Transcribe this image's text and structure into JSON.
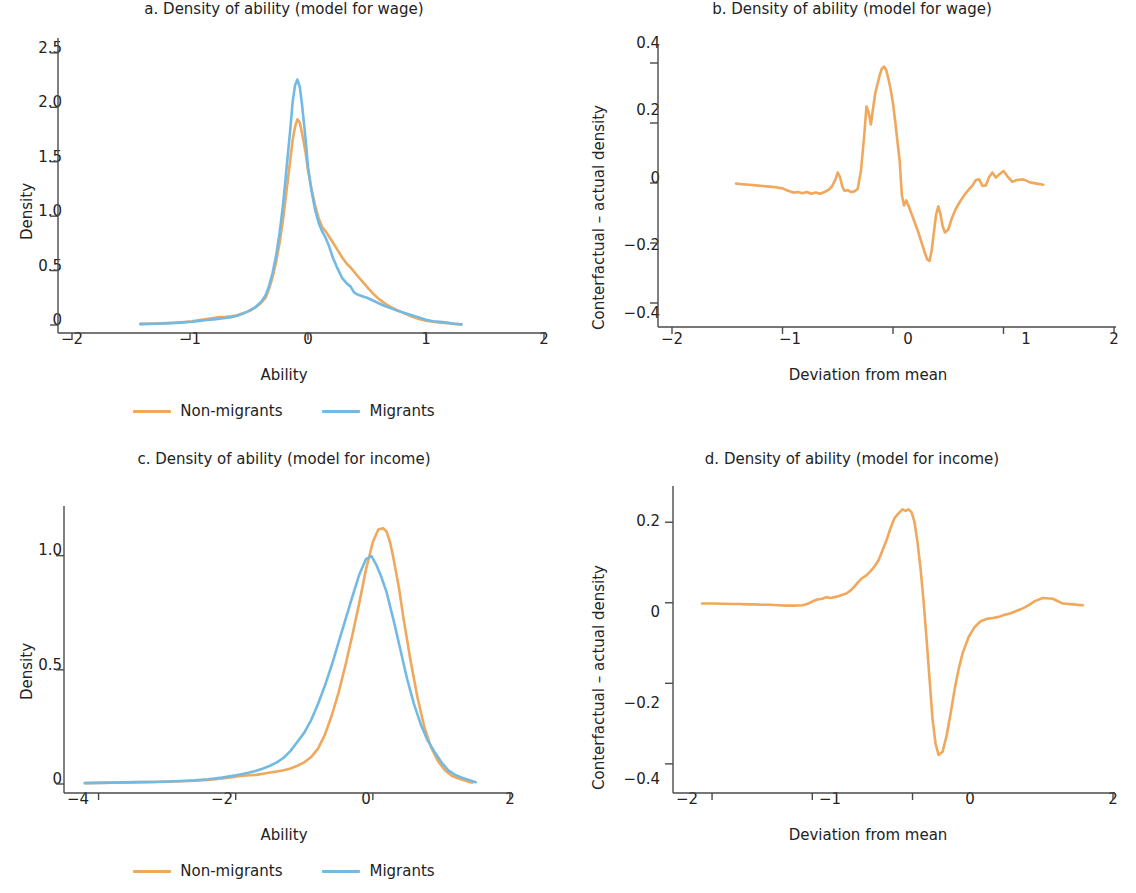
{
  "figure": {
    "background": "#ffffff",
    "series_colors": {
      "non_migrants": "#efa85c",
      "migrants": "#72bae4"
    },
    "axis_color": "#4a4a4a",
    "text_color": "#232323"
  },
  "legend": {
    "items": [
      {
        "label": "Non-migrants",
        "color": "#efa85c"
      },
      {
        "label": "Migrants",
        "color": "#72bae4"
      }
    ]
  },
  "panels": [
    {
      "id": "a",
      "title": "a. Density of ability (model for wage)",
      "xlabel": "Ability",
      "ylabel": "Density",
      "xticks": [
        "−2",
        "−1",
        "0",
        "1",
        "2"
      ],
      "yticks": [
        "0",
        "0.5",
        "1.0",
        "1.5",
        "2.0",
        "2.5"
      ]
    },
    {
      "id": "b",
      "title": "b. Density of ability (model for wage)",
      "xlabel": "Deviation from mean",
      "ylabel": "Conterfactual – actual density",
      "xticks": [
        "−2",
        "−1",
        "0",
        "1",
        "2"
      ],
      "yticks": [
        "−0.4",
        "−0.2",
        "0",
        "0.2",
        "0.4"
      ]
    },
    {
      "id": "c",
      "title": "c. Density of ability (model for income)",
      "xlabel": "Ability",
      "ylabel": "Density",
      "xticks": [
        "−4",
        "−2",
        "0",
        "2"
      ],
      "yticks": [
        "0",
        "0.5",
        "1.0"
      ]
    },
    {
      "id": "d",
      "title": "d. Density of ability (model for income)",
      "xlabel": "Deviation from mean",
      "ylabel": "Conterfactual – actual density",
      "xticks": [
        "−2",
        "−1",
        "0",
        "2"
      ],
      "yticks": [
        "−0.4",
        "−0.2",
        "0",
        "0.2"
      ]
    }
  ],
  "chart_data": [
    {
      "panel": "a",
      "type": "line",
      "title": "a. Density of ability (model for wage)",
      "xlabel": "Ability",
      "ylabel": "Density",
      "xlim": [
        -2,
        2
      ],
      "ylim": [
        0,
        2.6
      ],
      "xticks": [
        -2,
        -1,
        0,
        1,
        2
      ],
      "yticks": [
        0,
        0.5,
        1.0,
        1.5,
        2.0,
        2.5
      ],
      "grid": false,
      "legend_position": "below",
      "series": [
        {
          "name": "Non-migrants",
          "color": "#efa85c",
          "x": [
            -1.42,
            -1.35,
            -1.28,
            -1.2,
            -1.12,
            -1.05,
            -0.98,
            -0.92,
            -0.86,
            -0.8,
            -0.75,
            -0.7,
            -0.65,
            -0.6,
            -0.56,
            -0.52,
            -0.48,
            -0.44,
            -0.4,
            -0.36,
            -0.33,
            -0.3,
            -0.27,
            -0.24,
            -0.21,
            -0.18,
            -0.15,
            -0.13,
            -0.11,
            -0.09,
            -0.07,
            -0.05,
            -0.02,
            0.0,
            0.03,
            0.06,
            0.09,
            0.12,
            0.15,
            0.18,
            0.21,
            0.25,
            0.29,
            0.33,
            0.36,
            0.39,
            0.42,
            0.46,
            0.5,
            0.55,
            0.6,
            0.65,
            0.7,
            0.76,
            0.82,
            0.88,
            0.94,
            1.0,
            1.06,
            1.12,
            1.18,
            1.24,
            1.3
          ],
          "y": [
            0.01,
            0.012,
            0.014,
            0.018,
            0.022,
            0.028,
            0.035,
            0.045,
            0.055,
            0.065,
            0.072,
            0.075,
            0.08,
            0.09,
            0.105,
            0.12,
            0.14,
            0.165,
            0.2,
            0.25,
            0.33,
            0.44,
            0.58,
            0.76,
            0.98,
            1.25,
            1.52,
            1.7,
            1.82,
            1.89,
            1.86,
            1.76,
            1.58,
            1.42,
            1.25,
            1.1,
            0.98,
            0.9,
            0.86,
            0.81,
            0.76,
            0.69,
            0.62,
            0.56,
            0.53,
            0.49,
            0.45,
            0.4,
            0.35,
            0.29,
            0.24,
            0.2,
            0.165,
            0.135,
            0.105,
            0.078,
            0.055,
            0.04,
            0.03,
            0.022,
            0.016,
            0.01,
            0.006
          ]
        },
        {
          "name": "Migrants",
          "color": "#72bae4",
          "x": [
            -1.42,
            -1.35,
            -1.28,
            -1.2,
            -1.12,
            -1.05,
            -0.98,
            -0.92,
            -0.86,
            -0.8,
            -0.75,
            -0.7,
            -0.65,
            -0.6,
            -0.56,
            -0.52,
            -0.48,
            -0.44,
            -0.4,
            -0.36,
            -0.33,
            -0.3,
            -0.27,
            -0.24,
            -0.21,
            -0.18,
            -0.15,
            -0.13,
            -0.11,
            -0.09,
            -0.07,
            -0.05,
            -0.02,
            0.0,
            0.03,
            0.06,
            0.09,
            0.12,
            0.15,
            0.18,
            0.21,
            0.25,
            0.29,
            0.33,
            0.36,
            0.39,
            0.42,
            0.46,
            0.5,
            0.55,
            0.6,
            0.65,
            0.7,
            0.76,
            0.82,
            0.88,
            0.94,
            1.0,
            1.06,
            1.12,
            1.18,
            1.24,
            1.3
          ],
          "y": [
            0.008,
            0.01,
            0.012,
            0.015,
            0.019,
            0.024,
            0.03,
            0.038,
            0.046,
            0.052,
            0.058,
            0.064,
            0.072,
            0.085,
            0.1,
            0.118,
            0.14,
            0.17,
            0.21,
            0.27,
            0.36,
            0.48,
            0.64,
            0.85,
            1.12,
            1.46,
            1.8,
            2.05,
            2.2,
            2.255,
            2.19,
            2.02,
            1.7,
            1.45,
            1.23,
            1.06,
            0.94,
            0.86,
            0.8,
            0.72,
            0.62,
            0.52,
            0.43,
            0.38,
            0.355,
            0.3,
            0.28,
            0.265,
            0.25,
            0.225,
            0.2,
            0.175,
            0.155,
            0.13,
            0.11,
            0.09,
            0.07,
            0.048,
            0.035,
            0.03,
            0.022,
            0.012,
            0.006
          ]
        }
      ]
    },
    {
      "panel": "b",
      "type": "line",
      "title": "b. Density of ability (model for wage)",
      "xlabel": "Deviation from mean",
      "ylabel": "Conterfactual – actual density",
      "xlim": [
        -2,
        2
      ],
      "ylim": [
        -0.45,
        0.45
      ],
      "xticks": [
        -2,
        -1,
        0,
        1,
        2
      ],
      "yticks": [
        -0.4,
        -0.2,
        0,
        0.2,
        0.4
      ],
      "grid": false,
      "legend_position": "none",
      "series": [
        {
          "name": "Conterfactual – actual density",
          "color": "#efa85c",
          "x": [
            -1.42,
            -1.36,
            -1.3,
            -1.24,
            -1.18,
            -1.12,
            -1.06,
            -1.0,
            -0.95,
            -0.9,
            -0.86,
            -0.82,
            -0.78,
            -0.74,
            -0.7,
            -0.66,
            -0.62,
            -0.58,
            -0.55,
            -0.52,
            -0.5,
            -0.48,
            -0.46,
            -0.44,
            -0.41,
            -0.38,
            -0.35,
            -0.32,
            -0.29,
            -0.26,
            -0.24,
            -0.22,
            -0.2,
            -0.18,
            -0.16,
            -0.14,
            -0.12,
            -0.1,
            -0.08,
            -0.06,
            -0.04,
            -0.02,
            0.0,
            0.02,
            0.04,
            0.06,
            0.08,
            0.1,
            0.12,
            0.14,
            0.17,
            0.2,
            0.23,
            0.26,
            0.29,
            0.31,
            0.33,
            0.35,
            0.37,
            0.39,
            0.41,
            0.43,
            0.45,
            0.47,
            0.5,
            0.53,
            0.57,
            0.61,
            0.65,
            0.69,
            0.72,
            0.75,
            0.78,
            0.81,
            0.84,
            0.87,
            0.9,
            0.93,
            0.96,
            1.0,
            1.04,
            1.08,
            1.12,
            1.18,
            1.24,
            1.3,
            1.36
          ],
          "y": [
            -0.002,
            -0.004,
            -0.006,
            -0.008,
            -0.01,
            -0.012,
            -0.014,
            -0.018,
            -0.026,
            -0.032,
            -0.03,
            -0.034,
            -0.03,
            -0.036,
            -0.032,
            -0.036,
            -0.03,
            -0.022,
            -0.01,
            0.012,
            0.035,
            0.02,
            -0.01,
            -0.026,
            -0.024,
            -0.03,
            -0.028,
            -0.02,
            0.04,
            0.16,
            0.255,
            0.235,
            0.195,
            0.25,
            0.3,
            0.33,
            0.36,
            0.382,
            0.388,
            0.375,
            0.345,
            0.31,
            0.265,
            0.205,
            0.14,
            0.075,
            -0.04,
            -0.075,
            -0.058,
            -0.075,
            -0.105,
            -0.135,
            -0.165,
            -0.2,
            -0.235,
            -0.255,
            -0.26,
            -0.225,
            -0.165,
            -0.105,
            -0.078,
            -0.105,
            -0.145,
            -0.165,
            -0.155,
            -0.12,
            -0.085,
            -0.06,
            -0.038,
            -0.02,
            -0.008,
            0.01,
            0.012,
            -0.01,
            -0.008,
            0.02,
            0.035,
            0.018,
            0.028,
            0.04,
            0.02,
            0.004,
            0.01,
            0.012,
            0.002,
            -0.002,
            -0.006
          ]
        }
      ]
    },
    {
      "panel": "c",
      "type": "line",
      "title": "c. Density of ability (model for income)",
      "xlabel": "Ability",
      "ylabel": "Density",
      "xlim": [
        -4.3,
        2.0
      ],
      "ylim": [
        0,
        1.2
      ],
      "xticks": [
        -4,
        -2,
        0,
        2
      ],
      "yticks": [
        0,
        0.5,
        1.0
      ],
      "grid": false,
      "legend_position": "below",
      "series": [
        {
          "name": "Non-migrants",
          "color": "#efa85c",
          "x": [
            -4.2,
            -4.0,
            -3.8,
            -3.6,
            -3.4,
            -3.2,
            -3.0,
            -2.8,
            -2.6,
            -2.4,
            -2.2,
            -2.0,
            -1.9,
            -1.8,
            -1.7,
            -1.6,
            -1.5,
            -1.4,
            -1.3,
            -1.2,
            -1.1,
            -1.0,
            -0.9,
            -0.8,
            -0.7,
            -0.6,
            -0.5,
            -0.4,
            -0.3,
            -0.2,
            -0.1,
            0.0,
            0.08,
            0.15,
            0.2,
            0.25,
            0.3,
            0.38,
            0.45,
            0.55,
            0.65,
            0.75,
            0.85,
            0.95,
            1.05,
            1.15,
            1.25,
            1.35,
            1.45
          ],
          "y": [
            0.004,
            0.005,
            0.006,
            0.007,
            0.008,
            0.009,
            0.01,
            0.012,
            0.014,
            0.018,
            0.024,
            0.032,
            0.036,
            0.038,
            0.04,
            0.045,
            0.05,
            0.055,
            0.06,
            0.068,
            0.08,
            0.095,
            0.118,
            0.155,
            0.215,
            0.3,
            0.4,
            0.52,
            0.65,
            0.79,
            0.94,
            1.06,
            1.115,
            1.12,
            1.105,
            1.06,
            0.99,
            0.86,
            0.72,
            0.54,
            0.38,
            0.25,
            0.16,
            0.1,
            0.06,
            0.036,
            0.024,
            0.014,
            0.006
          ]
        },
        {
          "name": "Migrants",
          "color": "#72bae4",
          "x": [
            -4.2,
            -4.0,
            -3.8,
            -3.6,
            -3.4,
            -3.2,
            -3.0,
            -2.8,
            -2.6,
            -2.4,
            -2.2,
            -2.0,
            -1.9,
            -1.8,
            -1.7,
            -1.6,
            -1.5,
            -1.4,
            -1.3,
            -1.2,
            -1.1,
            -1.0,
            -0.9,
            -0.8,
            -0.7,
            -0.6,
            -0.5,
            -0.4,
            -0.3,
            -0.2,
            -0.1,
            -0.02,
            0.05,
            0.12,
            0.2,
            0.3,
            0.4,
            0.5,
            0.6,
            0.7,
            0.8,
            0.9,
            1.0,
            1.1,
            1.2,
            1.3,
            1.4,
            1.5
          ],
          "y": [
            0.004,
            0.005,
            0.006,
            0.007,
            0.008,
            0.009,
            0.011,
            0.013,
            0.016,
            0.021,
            0.028,
            0.038,
            0.044,
            0.05,
            0.058,
            0.068,
            0.08,
            0.095,
            0.115,
            0.145,
            0.185,
            0.225,
            0.28,
            0.35,
            0.43,
            0.52,
            0.62,
            0.72,
            0.82,
            0.915,
            0.985,
            0.998,
            0.96,
            0.91,
            0.84,
            0.72,
            0.59,
            0.46,
            0.35,
            0.26,
            0.19,
            0.14,
            0.095,
            0.06,
            0.04,
            0.028,
            0.018,
            0.008
          ]
        }
      ]
    },
    {
      "panel": "d",
      "type": "line",
      "title": "d. Density of ability (model for income)",
      "xlabel": "Deviation from mean",
      "ylabel": "Conterfactual – actual density",
      "xlim": [
        -2.25,
        2.0
      ],
      "ylim": [
        -0.45,
        0.28
      ],
      "xticks": [
        -2,
        -1,
        0,
        2
      ],
      "yticks": [
        -0.4,
        -0.2,
        0,
        0.2
      ],
      "grid": false,
      "legend_position": "none",
      "series": [
        {
          "name": "Conterfactual – actual density",
          "color": "#efa85c",
          "x": [
            -2.1,
            -2.0,
            -1.8,
            -1.72,
            -1.65,
            -1.58,
            -1.5,
            -1.42,
            -1.34,
            -1.26,
            -1.18,
            -1.1,
            -1.05,
            -1.0,
            -0.95,
            -0.9,
            -0.86,
            -0.82,
            -0.78,
            -0.74,
            -0.7,
            -0.66,
            -0.62,
            -0.58,
            -0.54,
            -0.5,
            -0.46,
            -0.42,
            -0.38,
            -0.34,
            -0.3,
            -0.26,
            -0.22,
            -0.18,
            -0.14,
            -0.1,
            -0.07,
            -0.04,
            -0.01,
            0.02,
            0.05,
            0.08,
            0.11,
            0.14,
            0.17,
            0.2,
            0.23,
            0.26,
            0.3,
            0.34,
            0.38,
            0.42,
            0.46,
            0.5,
            0.56,
            0.62,
            0.68,
            0.74,
            0.8,
            0.86,
            0.92,
            0.98,
            1.04,
            1.1,
            1.16,
            1.22,
            1.3,
            1.4,
            1.5,
            1.6,
            1.7
          ],
          "y": [
            -0.002,
            -0.002,
            -0.003,
            -0.003,
            -0.004,
            -0.004,
            -0.005,
            -0.005,
            -0.006,
            -0.007,
            -0.007,
            -0.006,
            -0.003,
            0.003,
            0.008,
            0.01,
            0.014,
            0.012,
            0.014,
            0.016,
            0.02,
            0.023,
            0.03,
            0.04,
            0.052,
            0.062,
            0.068,
            0.078,
            0.09,
            0.105,
            0.13,
            0.155,
            0.185,
            0.21,
            0.222,
            0.232,
            0.228,
            0.232,
            0.225,
            0.2,
            0.15,
            0.085,
            0.005,
            -0.09,
            -0.19,
            -0.29,
            -0.35,
            -0.378,
            -0.37,
            -0.33,
            -0.275,
            -0.215,
            -0.165,
            -0.125,
            -0.085,
            -0.06,
            -0.046,
            -0.04,
            -0.038,
            -0.035,
            -0.03,
            -0.026,
            -0.02,
            -0.014,
            -0.006,
            0.004,
            0.012,
            0.01,
            -0.002,
            -0.004,
            -0.006
          ]
        }
      ]
    }
  ]
}
